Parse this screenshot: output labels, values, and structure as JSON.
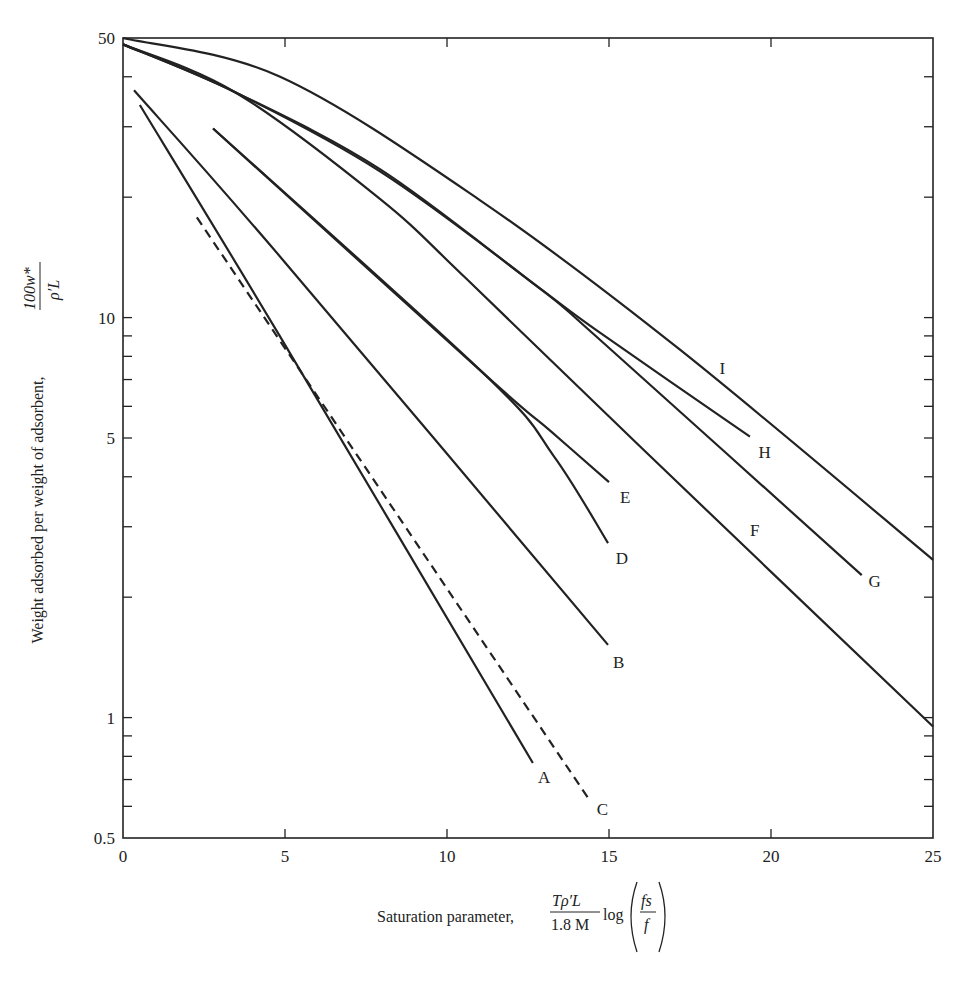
{
  "chart_data": {
    "type": "line",
    "title": "",
    "xlabel": "Saturation parameter,",
    "xlabel_formula": {
      "numerator": "Tρ′L",
      "denominator": "1.8 M",
      "func": "log",
      "frac_num": "fs",
      "frac_den": "f"
    },
    "ylabel": "Weight adsorbed per weight of adsorbent,",
    "ylabel_formula": {
      "numerator": "100w*",
      "denominator": "ρ′L"
    },
    "xlim": [
      0,
      25
    ],
    "ylim": [
      0.5,
      50
    ],
    "yscale": "log",
    "grid": false,
    "x_ticks": [
      0,
      5,
      10,
      15,
      20,
      25
    ],
    "x_tick_labels": [
      "0",
      "5",
      "10",
      "15",
      "20",
      "25"
    ],
    "y_major_ticks": [
      0.5,
      1,
      5,
      10,
      50
    ],
    "y_tick_labels": [
      "0.5",
      "1",
      "5",
      "10",
      "50"
    ],
    "y_minor_ticks": [
      0.6,
      0.7,
      0.8,
      0.9,
      2,
      3,
      4,
      6,
      7,
      8,
      9,
      20,
      30,
      40
    ],
    "series": [
      {
        "name": "A",
        "style": "solid",
        "points": [
          [
            0.52,
            34.0
          ],
          [
            4.85,
            8.96
          ],
          [
            12.65,
            0.77
          ]
        ],
        "label_at": [
          13.0,
          0.71
        ]
      },
      {
        "name": "B",
        "style": "solid",
        "points": [
          [
            0.34,
            37.0
          ],
          [
            4.85,
            14.2
          ],
          [
            14.97,
            1.52
          ]
        ],
        "label_at": [
          15.3,
          1.38
        ]
      },
      {
        "name": "C",
        "style": "dashed",
        "points": [
          [
            2.28,
            17.8
          ],
          [
            14.41,
            0.62
          ]
        ],
        "label_at": [
          14.8,
          0.59
        ]
      },
      {
        "name": "D",
        "style": "solid",
        "points": [
          [
            2.78,
            29.7
          ],
          [
            11.17,
            7.2
          ],
          [
            13.3,
            4.5
          ],
          [
            14.97,
            2.73
          ]
        ],
        "label_at": [
          15.4,
          2.5
        ]
      },
      {
        "name": "E",
        "style": "solid",
        "points": [
          [
            2.78,
            29.7
          ],
          [
            11.17,
            7.2
          ],
          [
            13.2,
            5.2
          ],
          [
            15.0,
            3.88
          ]
        ],
        "label_at": [
          15.5,
          3.55
        ]
      },
      {
        "name": "F",
        "style": "solid",
        "points": [
          [
            0,
            48.2
          ],
          [
            3.46,
            36.6
          ],
          [
            7.93,
            19.8
          ],
          [
            10.6,
            12.5
          ],
          [
            15.96,
            4.76
          ],
          [
            25,
            0.95
          ]
        ],
        "label_at": [
          19.5,
          2.95
        ]
      },
      {
        "name": "G",
        "style": "solid",
        "points": [
          [
            0,
            48.2
          ],
          [
            3.46,
            36.6
          ],
          [
            7.93,
            23.2
          ],
          [
            12.65,
            12.2
          ],
          [
            14.72,
            8.8
          ],
          [
            22.8,
            2.27
          ]
        ],
        "label_at": [
          23.2,
          2.2
        ]
      },
      {
        "name": "H",
        "style": "solid",
        "points": [
          [
            0,
            48.2
          ],
          [
            3.46,
            36.6
          ],
          [
            7.93,
            23.5
          ],
          [
            12.65,
            12.2
          ],
          [
            14.72,
            9.17
          ],
          [
            19.35,
            5.04
          ]
        ],
        "label_at": [
          19.8,
          4.6
        ]
      },
      {
        "name": "I",
        "style": "solid",
        "points": [
          [
            0,
            50.0
          ],
          [
            4.85,
            40.0
          ],
          [
            11.0,
            19.7
          ],
          [
            17.2,
            8.3
          ],
          [
            25,
            2.48
          ]
        ],
        "label_at": [
          18.5,
          7.5
        ]
      }
    ]
  }
}
